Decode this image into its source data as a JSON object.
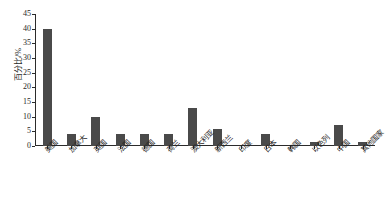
{
  "chart_data": {
    "type": "bar",
    "title": "",
    "subtitle": "",
    "xlabel": "",
    "ylabel": "百分比/%",
    "ylim": [
      0,
      45
    ],
    "yticks": [
      0,
      5,
      10,
      15,
      20,
      25,
      30,
      35,
      40,
      45
    ],
    "grid": false,
    "legend": null,
    "legend_position": "none",
    "bar_color": "#4a4a4a",
    "axis_color": "#2b2b2b",
    "categories": [
      "美国",
      "加拿大",
      "英国",
      "法国",
      "德国",
      "荷兰",
      "澳大利亚",
      "新西兰",
      "印度",
      "日本",
      "韩国",
      "以色列",
      "中国",
      "其他国家"
    ],
    "values": [
      40,
      4.2,
      10,
      4.2,
      4.2,
      4.2,
      12.8,
      5.7,
      0,
      4.2,
      0,
      1.4,
      7.1,
      1.4
    ]
  }
}
